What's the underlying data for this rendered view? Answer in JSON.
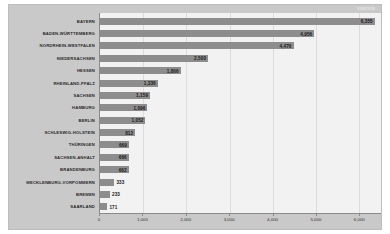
{
  "watermark": "statista",
  "chart_data": {
    "type": "bar",
    "orientation": "horizontal",
    "title": "",
    "subtitle": "",
    "xlabel": "",
    "ylabel": "",
    "xlim": [
      0,
      6500
    ],
    "grid": true,
    "legend": "none",
    "bar_color": "#8d8d8d",
    "plot_background": "#f2f2f2",
    "frame_color": "#c9c9c9",
    "xticks": [
      0,
      1000,
      2000,
      3000,
      4000,
      5000,
      6000
    ],
    "xticklabels": [
      "0",
      "1,000",
      "2,000",
      "3,000",
      "4,000",
      "5,000",
      "6,000"
    ],
    "categories": [
      "BAYERN",
      "BADEN-WÜRTTEMBERG",
      "NORDRHEIN-WESTFALEN",
      "NIEDERSACHSEN",
      "HESSEN",
      "RHEINLAND-PFALZ",
      "SACHSEN",
      "HAMBURG",
      "BERLIN",
      "SCHLESWIG-HOLSTEIN",
      "THÜRINGEN",
      "SACHSEN-ANHALT",
      "BRANDENBURG",
      "MECKLENBURG-VORPOMMERN",
      "BREMEN",
      "SAARLAND"
    ],
    "values": [
      6355,
      4956,
      4476,
      2500,
      1866,
      1336,
      1159,
      1096,
      1052,
      812,
      669,
      666,
      662,
      333,
      233,
      171
    ],
    "valuelabels": [
      "6,355",
      "4,956",
      "4,476",
      "2,500",
      "1,866",
      "1,336",
      "1,159",
      "1,096",
      "1,052",
      "812",
      "669",
      "666",
      "662",
      "333",
      "233",
      "171"
    ]
  }
}
